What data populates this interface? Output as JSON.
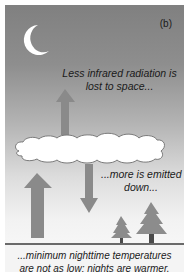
{
  "figure": {
    "panel_label": "(b)",
    "captions": {
      "top": [
        "Less infrared radiation is",
        "lost to space..."
      ],
      "middle": [
        "...more is emitted",
        "down..."
      ],
      "bottom": [
        "...minimum nighttime temperatures",
        "are not as low: nights are warmer."
      ]
    },
    "elements": {
      "moon": "crescent-moon",
      "cloud": "cloud",
      "arrows": [
        "small-up-arrow-to-space",
        "large-up-arrow-from-ground",
        "down-arrow-from-cloud"
      ],
      "trees": [
        "small-tree",
        "large-tree"
      ]
    },
    "colors": {
      "sky_top": "#808080",
      "sky_bottom": "#f6f6f6",
      "arrow": "#8a8a8a",
      "tree": "#8c8c8c",
      "trunk": "#4a4a4a",
      "cloud_fill": "#ffffff",
      "ground": "#6a6a6a"
    }
  }
}
